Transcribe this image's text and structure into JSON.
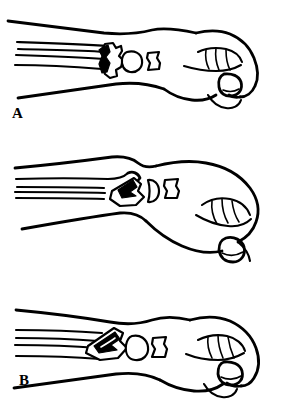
{
  "figure": {
    "panel_count": 3,
    "style": "black-ink-line-drawing",
    "background_color": "#ffffff",
    "ink_color": "#000000"
  },
  "panels": [
    {
      "id": "panel-a",
      "label": "A",
      "caption": "Neutral wrist alignment with intact distal radius and ulna",
      "wrist_position": "neutral",
      "hand_position": "clenched fist",
      "bone_state": "aligned",
      "forearm_bones": [
        "radius",
        "ulna"
      ],
      "carpal_bones": [
        "lunate",
        "capitate",
        "scaphoid"
      ]
    },
    {
      "id": "panel-b",
      "label": "B",
      "caption": "Dorsiflexed wrist with displaced wedge-shaped bone fragment",
      "wrist_position": "dorsiflexed",
      "hand_position": "clenched fist",
      "bone_state": "displaced fragment",
      "forearm_bones": [
        "radius",
        "ulna"
      ],
      "carpal_bones": [
        "lunate",
        "capitate",
        "scaphoid"
      ]
    },
    {
      "id": "panel-c",
      "label": "C",
      "caption": "Volar angulated wrist with impacted bone fragment",
      "wrist_position": "volar angulated",
      "hand_position": "clenched fist",
      "bone_state": "impacted fragment",
      "forearm_bones": [
        "radius",
        "ulna"
      ],
      "carpal_bones": [
        "lunate",
        "capitate",
        "scaphoid"
      ]
    }
  ]
}
